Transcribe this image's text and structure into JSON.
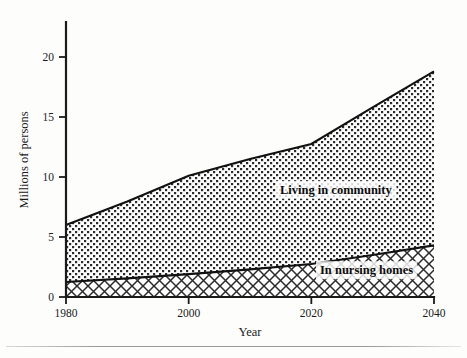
{
  "chart_data": {
    "type": "area",
    "title": "",
    "subtitle": "",
    "xlabel": "Year",
    "ylabel": "Millions of persons",
    "xlim": [
      1980,
      2040
    ],
    "ylim": [
      0,
      20
    ],
    "xticks": [
      1980,
      2000,
      2020,
      2040
    ],
    "yticks": [
      0,
      5,
      10,
      15,
      20
    ],
    "xtick_labels": [
      "1980",
      "2000",
      "2020",
      "2040"
    ],
    "ytick_labels": [
      "0",
      "5",
      "10",
      "15",
      "20"
    ],
    "grid": false,
    "legend_position": "inline-annotations",
    "stacked": true,
    "x": [
      1980,
      1990,
      2000,
      2010,
      2020,
      2030,
      2040
    ],
    "series": [
      {
        "name": "In nursing homes",
        "label": "In nursing homes",
        "pattern": "cross-hatch",
        "values": [
          1.25,
          1.55,
          1.9,
          2.3,
          2.75,
          3.5,
          4.3
        ]
      },
      {
        "name": "Living in community",
        "label": "Living in community",
        "pattern": "dotted-grid",
        "values": [
          4.75,
          6.4,
          8.2,
          9.2,
          10.0,
          12.3,
          14.5
        ]
      }
    ],
    "cumulative_totals": [
      6.0,
      7.95,
      10.1,
      11.5,
      12.75,
      15.8,
      18.8
    ],
    "annotations": [
      {
        "text": "Living in community",
        "x": 2024,
        "y": 8.6
      },
      {
        "text": "In nursing homes",
        "x": 2029,
        "y": 1.9
      }
    ]
  },
  "colors": {
    "ink": "#1a1a1a",
    "line": "#111111",
    "background": "#fdfdfc",
    "pattern_fill": "#2b2b2b"
  }
}
